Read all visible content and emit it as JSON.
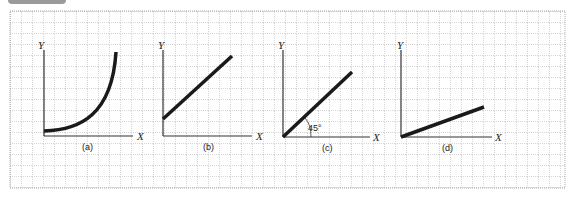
{
  "figure": {
    "panels": [
      {
        "id": "a",
        "caption": "(a)",
        "x_axis_label": "X",
        "y_axis_label": "Y",
        "curve": "exponential increasing"
      },
      {
        "id": "b",
        "caption": "(b)",
        "x_axis_label": "X",
        "y_axis_label": "Y",
        "curve": "linear with positive intercept"
      },
      {
        "id": "c",
        "caption": "(c)",
        "x_axis_label": "X",
        "y_axis_label": "Y",
        "curve": "linear through origin at 45°",
        "angle_label": "45°"
      },
      {
        "id": "d",
        "caption": "(d)",
        "x_axis_label": "X",
        "y_axis_label": "Y",
        "curve": "linear through origin shallow slope"
      }
    ],
    "colors": {
      "grid": "#8a8a8a",
      "line": "#1a1a1a",
      "axis": "#333333",
      "tab": "#9a9a9a"
    }
  }
}
